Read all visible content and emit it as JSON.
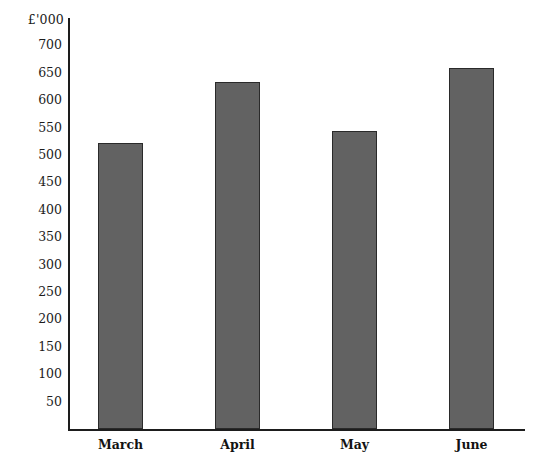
{
  "chart_data": {
    "type": "bar",
    "title": "",
    "subtitle": "",
    "unit_label": "£'000",
    "xlabel": "",
    "ylabel": "£'000",
    "categories": [
      "March",
      "April",
      "May",
      "June"
    ],
    "values": [
      522,
      634,
      544,
      659
    ],
    "series": [
      {
        "name": "Monthly figure",
        "values": [
          522,
          634,
          544,
          659
        ]
      }
    ],
    "ylim": [
      0,
      725
    ],
    "yticks": [
      50,
      100,
      150,
      200,
      250,
      300,
      350,
      400,
      450,
      500,
      550,
      600,
      650,
      700
    ],
    "ytick_labels": [
      "50",
      "100",
      "150",
      "200",
      "250",
      "300",
      "350",
      "400",
      "450",
      "500",
      "550",
      "600",
      "650",
      "700"
    ],
    "grid": false,
    "legend": false,
    "legend_position": "none",
    "bar_color": "#626262",
    "bar_border_color": "#2a2a2a",
    "axis_color": "#1d1d1d",
    "background_color": "#ffffff",
    "annotations": []
  }
}
